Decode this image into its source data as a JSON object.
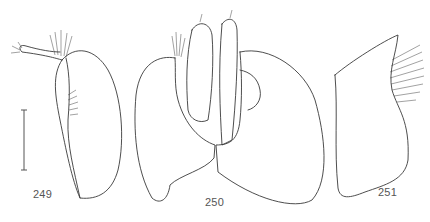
{
  "figure": {
    "labels": [
      "249",
      "250",
      "251"
    ]
  },
  "panels": [
    {
      "id": "249",
      "label": "249",
      "has_scale_bar": true
    },
    {
      "id": "250",
      "label": "250",
      "has_scale_bar": false
    },
    {
      "id": "251",
      "label": "251",
      "has_scale_bar": false
    }
  ],
  "scale_bar": {
    "label": ""
  },
  "colors": {
    "line": "#3a3a3a",
    "background": "#ffffff",
    "label_text": "#555555"
  }
}
